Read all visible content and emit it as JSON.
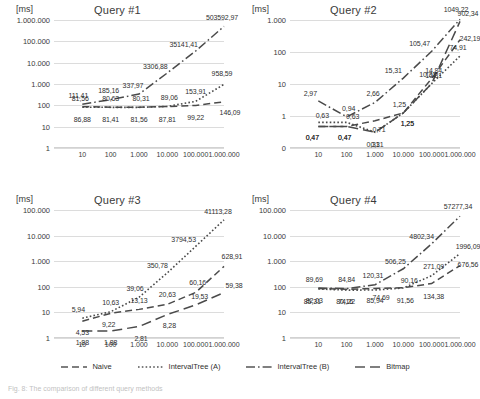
{
  "figure": {
    "caption": "Fig. 8: The comparison of different query methods",
    "x_axis_label": "",
    "y_unit": "[ms]",
    "x_ticks": [
      "10",
      "100",
      "1.000",
      "10.000",
      "100.000",
      "1.000.000"
    ],
    "x_values": [
      10,
      100,
      1000,
      10000,
      100000,
      1000000
    ]
  },
  "legend": {
    "position": "bottom",
    "items": [
      {
        "label": "Naive",
        "style": "dashed",
        "color": "#555555"
      },
      {
        "label": "IntervalTree (A)",
        "style": "dotted",
        "color": "#555555"
      },
      {
        "label": "IntervalTree (B)",
        "style": "dash-dot",
        "color": "#555555"
      },
      {
        "label": "Bitmap",
        "style": "long-dash",
        "color": "#555555"
      }
    ]
  },
  "chart_data": [
    {
      "type": "line",
      "title": "Query #1",
      "xlabel": "",
      "ylabel": "[ms]",
      "xscale": "log",
      "yscale": "log",
      "xlim": [
        1,
        1000000
      ],
      "ylim": [
        1,
        1000000
      ],
      "grid": true,
      "x": [
        10,
        100,
        1000,
        10000,
        100000,
        1000000
      ],
      "y_ticks": [
        "1",
        "10",
        "100",
        "1.000",
        "10.000",
        "100.000",
        "1.000.000"
      ],
      "series": [
        {
          "name": "Naive",
          "values": [
            86.88,
            81.41,
            81.56,
            87.81,
            99.22,
            146.09
          ],
          "labels": [
            "86,88",
            "81,41",
            "81,56",
            "87,81",
            "99,22",
            "146,09"
          ]
        },
        {
          "name": "IntervalTree (A)",
          "values": [
            81.56,
            80.63,
            80.31,
            89.06,
            153.91,
            958.59
          ],
          "labels": [
            "81,56",
            "80,63",
            "80,31",
            "89,06",
            "153,91",
            "958,59"
          ]
        },
        {
          "name": "IntervalTree (B)",
          "values": [
            111.41,
            185.16,
            337.97,
            3306.88,
            35141.41,
            503592.97
          ],
          "labels": [
            "111,41",
            "185,16",
            "337,97",
            "3306,88",
            "35141,41",
            "503592,97"
          ]
        }
      ]
    },
    {
      "type": "line",
      "title": "Query #2",
      "xlabel": "",
      "ylabel": "[ms]",
      "xscale": "log",
      "yscale": "log",
      "xlim": [
        1,
        1000000
      ],
      "ylim": [
        0.1,
        1000
      ],
      "grid": true,
      "x": [
        10,
        100,
        1000,
        10000,
        100000,
        1000000
      ],
      "y_ticks": [
        "0",
        "1",
        "10",
        "100",
        "1.000"
      ],
      "series": [
        {
          "name": "Naive",
          "values": [
            0.47,
            0.47,
            0.71,
            1.25,
            14.84,
            242.19
          ],
          "labels": [
            "0,47",
            "0,47",
            "0,71",
            "1,25",
            "14,84",
            "242,19"
          ]
        },
        {
          "name": "IntervalTree (A)",
          "values": [
            0.63,
            0.63,
            0.31,
            1.25,
            10.31,
            74.91
          ],
          "labels": [
            "0,63",
            "0,63",
            "0,31",
            "1,25",
            "10,31",
            "74,91"
          ]
        },
        {
          "name": "IntervalTree (B)",
          "values": [
            2.97,
            0.94,
            2.66,
            15.31,
            105.47,
            1049.22
          ],
          "labels": [
            "2,97",
            "0,94",
            "2,66",
            "15,31",
            "105,47",
            "1049,22"
          ]
        },
        {
          "name": "Bitmap",
          "values": [
            0.47,
            0.47,
            0.31,
            1.25,
            10.31,
            902.34
          ],
          "labels": [
            "0,47",
            "0,47",
            "0,31",
            "1,25",
            "10,31",
            "902,34"
          ]
        }
      ]
    },
    {
      "type": "line",
      "title": "Query #3",
      "xlabel": "",
      "ylabel": "[ms]",
      "xscale": "log",
      "yscale": "log",
      "xlim": [
        1,
        1000000
      ],
      "ylim": [
        1,
        100000
      ],
      "grid": true,
      "x": [
        10,
        100,
        1000,
        10000,
        100000,
        1000000
      ],
      "y_ticks": [
        "1",
        "10",
        "100",
        "1.000",
        "10.000",
        "100.000"
      ],
      "series": [
        {
          "name": "Naive",
          "values": [
            4.53,
            9.22,
            13.13,
            20.63,
            60.16,
            628.91
          ],
          "labels": [
            "4,53",
            "9,22",
            "13,13",
            "20,63",
            "60,16",
            "628,91"
          ]
        },
        {
          "name": "IntervalTree (A)",
          "values": [
            5.94,
            10.63,
            39.06,
            350.78,
            3794.53,
            41113.28
          ],
          "labels": [
            "5,94",
            "10,63",
            "39,06",
            "350,78",
            "3794,53",
            "41113,28"
          ]
        },
        {
          "name": "Bitmap",
          "values": [
            1.88,
            1.88,
            2.81,
            8.28,
            19.53,
            59.38
          ],
          "labels": [
            "1,88",
            "1,88",
            "2,81",
            "8,28",
            "19,53",
            "59,38"
          ]
        }
      ]
    },
    {
      "type": "line",
      "title": "Query #4",
      "xlabel": "",
      "ylabel": "[ms]",
      "xscale": "log",
      "yscale": "log",
      "xlim": [
        1,
        1000000
      ],
      "ylim": [
        1,
        100000
      ],
      "grid": true,
      "x": [
        10,
        100,
        1000,
        10000,
        100000,
        1000000
      ],
      "y_ticks": [
        "1",
        "10",
        "100",
        "1.000",
        "10.000",
        "100.000"
      ],
      "series": [
        {
          "name": "Naive",
          "values": [
            85.31,
            80.16,
            85.94,
            91.56,
            134.38,
            676.56
          ],
          "labels": [
            "85,31",
            "80,16",
            "85,94",
            "91,56",
            "134,38",
            "676,56"
          ]
        },
        {
          "name": "IntervalTree (A)",
          "values": [
            82.03,
            74.22,
            74.69,
            90.16,
            271.09,
            1996.09
          ],
          "labels": [
            "82,03",
            "74,22",
            "74,69",
            "90,16",
            "271,09",
            "1996,09"
          ]
        },
        {
          "name": "IntervalTree (B)",
          "values": [
            89.69,
            84.84,
            120.31,
            506.25,
            4802.34,
            57277.34
          ],
          "labels": [
            "89,69",
            "84,84",
            "120,31",
            "506,25",
            "4802,34",
            "57277,34"
          ]
        }
      ]
    }
  ]
}
